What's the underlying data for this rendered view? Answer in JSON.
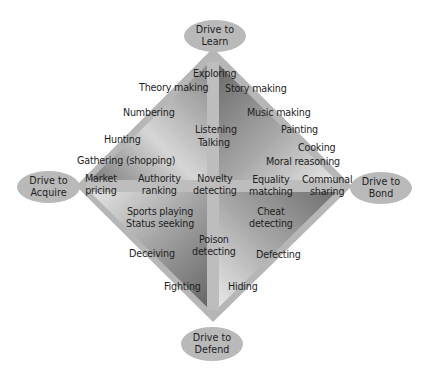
{
  "diagram": {
    "type": "diamond-four-drives",
    "drives": {
      "top": "Drive to Learn",
      "left": "Drive to Acquire",
      "right": "Drive to Bond",
      "bottom": "Drive to Defend"
    },
    "drive_lines": {
      "top": [
        "Drive to",
        "Learn"
      ],
      "left": [
        "Drive to",
        "Acquire"
      ],
      "right": [
        "Drive to",
        "Bond"
      ],
      "bottom": [
        "Drive to",
        "Defend"
      ]
    },
    "labels": {
      "exploring": "Exploring",
      "theory_making": "Theory making",
      "story_making": "Story making",
      "numbering": "Numbering",
      "music_making": "Music making",
      "listening": "Listening",
      "talking": "Talking",
      "painting": "Painting",
      "hunting": "Hunting",
      "cooking": "Cooking",
      "gathering": "Gathering (shopping)",
      "moral_reasoning": "Moral reasoning",
      "market": "Market",
      "pricing": "pricing",
      "authority": "Authority",
      "ranking": "ranking",
      "novelty": "Novelty",
      "novelty_detecting": "detecting",
      "equality": "Equality",
      "matching": "matching",
      "communal": "Communal",
      "sharing": "sharing",
      "sports_playing": "Sports playing",
      "status_seeking": "Status seeking",
      "cheat": "Cheat",
      "cheat_detecting": "detecting",
      "poison": "Poison",
      "poison_detecting": "detecting",
      "deceiving": "Deceiving",
      "defecting": "Defecting",
      "fighting": "Fighting",
      "hiding": "Hiding"
    },
    "colors": {
      "ellipse": "#b9b9b9",
      "band": "#b4b4b4",
      "dark": "#6f6f6f",
      "light": "#dcdcdc",
      "text": "#1e1e1e"
    }
  }
}
